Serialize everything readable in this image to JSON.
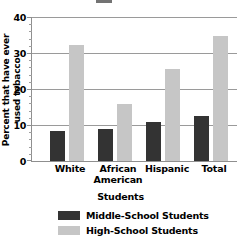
{
  "chart_data": {
    "type": "bar",
    "title": "",
    "xlabel": "Students",
    "ylabel": "Percent that have ever used tobacco",
    "ylabel_line1": "Percent that have ever",
    "ylabel_line2": "used tobacco",
    "categories": [
      "White",
      "African American",
      "Hispanic",
      "Total"
    ],
    "category_lines": [
      [
        "White"
      ],
      [
        "African",
        "American"
      ],
      [
        "Hispanic"
      ],
      [
        "Total"
      ]
    ],
    "series": [
      {
        "name": "Middle-School Students",
        "color": "#333333",
        "values": [
          8.3,
          9.0,
          10.8,
          12.5
        ]
      },
      {
        "name": "High-School Students",
        "color": "#c6c6c6",
        "values": [
          32.3,
          15.7,
          25.5,
          34.7
        ]
      }
    ],
    "ylim": [
      0,
      40
    ],
    "yticks": [
      0,
      10,
      20,
      30,
      40
    ],
    "ytick_labels": [
      "0",
      "10",
      "20",
      "30",
      "40"
    ],
    "y_minor_step": 2,
    "grid": true,
    "grid_axis": "y",
    "legend_position": "bottom",
    "axis_color": "#8f8f8f",
    "grid_color": "#9a9a9a",
    "background": "#ffffff"
  },
  "legend": {
    "items": [
      {
        "label": "Middle-School Students",
        "color": "#333333"
      },
      {
        "label": "High-School Students",
        "color": "#c6c6c6"
      }
    ]
  }
}
